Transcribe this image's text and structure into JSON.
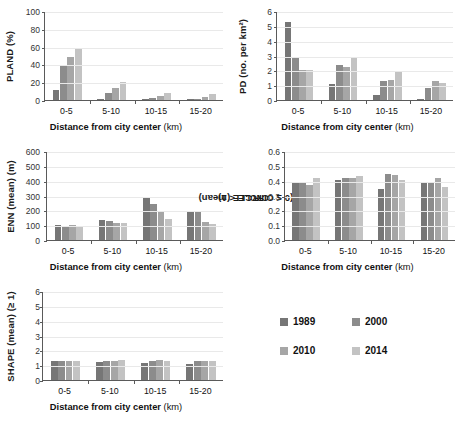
{
  "figure": {
    "xtitle_main": "Distance from city center",
    "xtitle_unit": "(km)",
    "categories": [
      "0-5",
      "5-10",
      "10-15",
      "15-20"
    ],
    "series_names": [
      "1989",
      "2000",
      "2010",
      "2014"
    ],
    "series_colors": [
      "#767676",
      "#8c8c8c",
      "#a6a6a6",
      "#c3c3c3"
    ]
  },
  "legend": {
    "items": [
      {
        "label": "1989",
        "color": "#767676"
      },
      {
        "label": "2000",
        "color": "#8c8c8c"
      },
      {
        "label": "2010",
        "color": "#a6a6a6"
      },
      {
        "label": "2014",
        "color": "#c3c3c3"
      }
    ]
  },
  "chart_data": [
    {
      "id": "pland",
      "type": "bar",
      "title": "",
      "ylabel": "PLAND (%)",
      "xlabel": "Distance from city center (km)",
      "categories": [
        "0-5",
        "5-10",
        "10-15",
        "15-20"
      ],
      "ylim": [
        0,
        100
      ],
      "yticks": [
        0,
        20,
        40,
        60,
        80,
        100
      ],
      "ytick_labels": [
        "0",
        "20",
        "40",
        "60",
        "80",
        "100"
      ],
      "grid": true,
      "legend_position": "external-bottom-right",
      "series": [
        {
          "name": "1989",
          "values": [
            11.8,
            0.6,
            0.3,
            0.2
          ]
        },
        {
          "name": "2000",
          "values": [
            37.8,
            8.2,
            2.3,
            0.9
          ]
        },
        {
          "name": "2010",
          "values": [
            48.8,
            13.8,
            4.8,
            3.6
          ]
        },
        {
          "name": "2014",
          "values": [
            58.2,
            20.0,
            8.0,
            6.8
          ]
        }
      ]
    },
    {
      "id": "pd",
      "type": "bar",
      "title": "",
      "ylabel": "PD (no. per km²)",
      "xlabel": "Distance from city center (km)",
      "categories": [
        "0-5",
        "5-10",
        "10-15",
        "15-20"
      ],
      "ylim": [
        0,
        6
      ],
      "yticks": [
        0,
        1,
        2,
        3,
        4,
        5,
        6
      ],
      "ytick_labels": [
        "0",
        "1",
        "2",
        "3",
        "4",
        "5",
        "6"
      ],
      "grid": true,
      "series": [
        {
          "name": "1989",
          "values": [
            5.28,
            1.05,
            0.35,
            0.08
          ]
        },
        {
          "name": "2000",
          "values": [
            2.9,
            2.35,
            1.25,
            0.82
          ]
        },
        {
          "name": "2010",
          "values": [
            2.05,
            2.25,
            1.35,
            1.28
          ]
        },
        {
          "name": "2014",
          "values": [
            2.05,
            2.8,
            1.98,
            1.15
          ]
        }
      ]
    },
    {
      "id": "enn",
      "type": "bar",
      "title": "",
      "ylabel": "ENN (mean) (m)",
      "xlabel": "Distance from city center (km)",
      "categories": [
        "0-5",
        "5-10",
        "10-15",
        "15-20"
      ],
      "ylim": [
        0,
        600
      ],
      "yticks": [
        0,
        100,
        200,
        300,
        400,
        500,
        600
      ],
      "ytick_labels": [
        "0",
        "100",
        "200",
        "300",
        "400",
        "500",
        "600"
      ],
      "grid": true,
      "series": [
        {
          "name": "1989",
          "values": [
            103,
            133,
            280,
            198
          ]
        },
        {
          "name": "2000",
          "values": [
            97,
            130,
            240,
            198
          ]
        },
        {
          "name": "2010",
          "values": [
            101,
            118,
            190,
            120
          ]
        },
        {
          "name": "2014",
          "values": [
            89,
            116,
            145,
            105
          ]
        }
      ]
    },
    {
      "id": "circle",
      "type": "bar",
      "title": "",
      "ylabel": "CIRCLE (mean)",
      "ylabel2": "(0 ≤ CIRCLE < 1)",
      "xlabel": "Distance from city center (km)",
      "categories": [
        "0-5",
        "5-10",
        "10-15",
        "15-20"
      ],
      "ylim": [
        0,
        0.6
      ],
      "yticks": [
        0.0,
        0.1,
        0.2,
        0.3,
        0.4,
        0.5,
        0.6
      ],
      "ytick_labels": [
        "0.0",
        "0.1",
        "0.2",
        "0.3",
        "0.4",
        "0.5",
        "0.6"
      ],
      "grid": true,
      "series": [
        {
          "name": "1989",
          "values": [
            0.393,
            0.402,
            0.345,
            0.386
          ]
        },
        {
          "name": "2000",
          "values": [
            0.389,
            0.418,
            0.445,
            0.383
          ]
        },
        {
          "name": "2010",
          "values": [
            0.368,
            0.421,
            0.438,
            0.419
          ]
        },
        {
          "name": "2014",
          "values": [
            0.419,
            0.433,
            0.404,
            0.36
          ]
        }
      ]
    },
    {
      "id": "shape",
      "type": "bar",
      "title": "",
      "ylabel": "SHAPE (mean) (≥ 1)",
      "xlabel": "Distance from city center (km)",
      "categories": [
        "0-5",
        "5-10",
        "10-15",
        "15-20"
      ],
      "ylim": [
        0,
        6
      ],
      "yticks": [
        0,
        1,
        2,
        3,
        4,
        5,
        6
      ],
      "ytick_labels": [
        "0",
        "1",
        "2",
        "3",
        "4",
        "5",
        "6"
      ],
      "grid": true,
      "series": [
        {
          "name": "1989",
          "values": [
            1.29,
            1.23,
            1.13,
            1.09
          ]
        },
        {
          "name": "2000",
          "values": [
            1.27,
            1.3,
            1.27,
            1.27
          ]
        },
        {
          "name": "2010",
          "values": [
            1.25,
            1.3,
            1.34,
            1.31
          ]
        },
        {
          "name": "2014",
          "values": [
            1.3,
            1.32,
            1.28,
            1.3
          ]
        }
      ]
    }
  ]
}
